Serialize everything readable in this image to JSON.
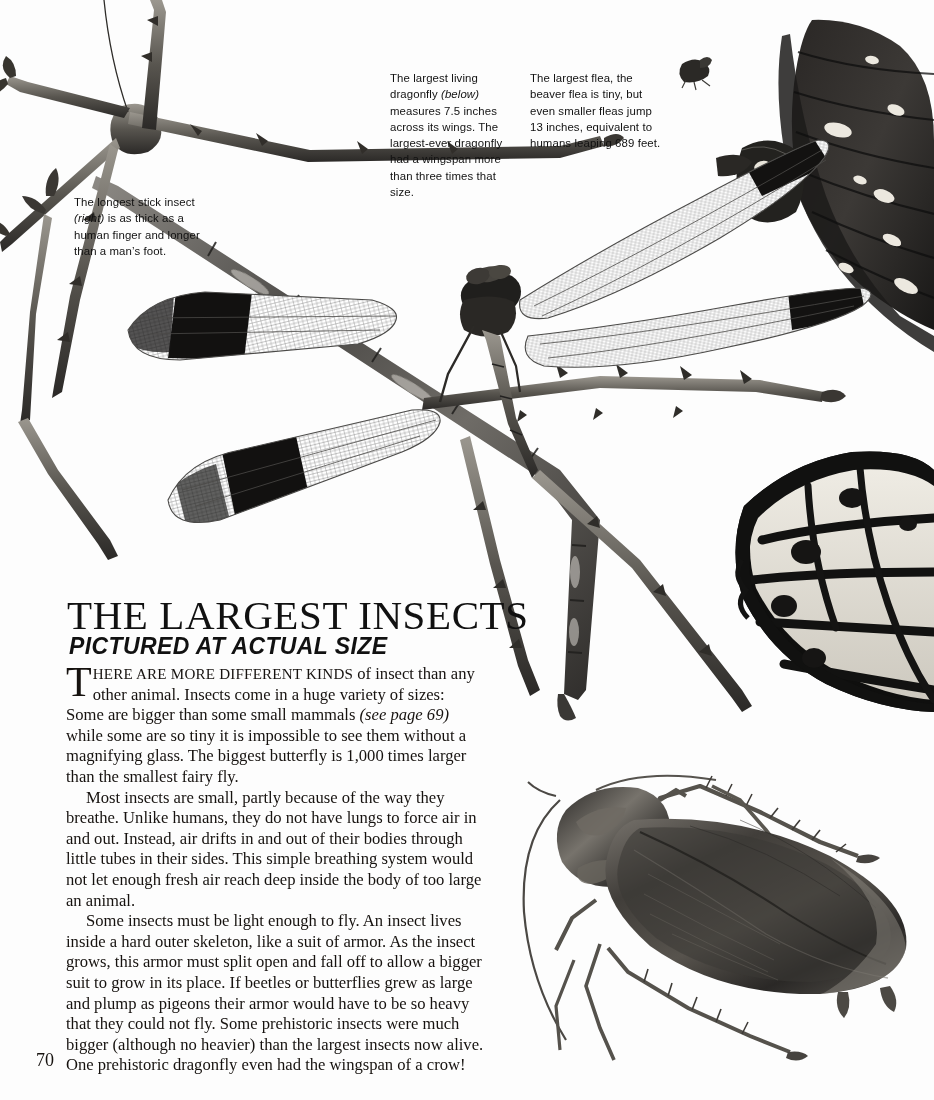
{
  "page": {
    "number": "70",
    "background": "#ffffff",
    "ink": "#111111"
  },
  "header": {
    "title": "THE LARGEST INSECTS",
    "subtitle": "PICTURED AT ACTUAL SIZE"
  },
  "captions": {
    "stick_insect": {
      "text_before": "The longest stick insect ",
      "italic": "(right)",
      "text_after": " is as thick as a human finger and longer than a man’s foot."
    },
    "dragonfly": {
      "text_before": "The largest living dragonfly ",
      "italic": "(below)",
      "text_after": " measures 7.5 inches across its wings. The largest-ever dragonfly had a wingspan more than three times that size."
    },
    "flea": {
      "text": "The largest flea, the beaver flea is tiny, but even smaller fleas jump 13 inches, equivalent to humans leaping 689 feet."
    }
  },
  "body": {
    "p1_dropcap": "T",
    "p1_smallcaps": "HERE ARE MORE DIFFERENT KINDS",
    "p1_part1": " of insect than any other animal. Insects come in a huge variety of sizes: Some are bigger than some small mammals ",
    "p1_italic": "(see page 69)",
    "p1_part2": " while some are so tiny it is impossible to see them without a magnifying glass. The biggest butterfly is 1,000 times larger than the smallest fairy fly.",
    "p2": "Most insects are small, partly because of the way they breathe. Unlike humans, they do not have lungs to force air in and out. Instead, air drifts in and out of their bodies through little tubes in their sides. This simple breathing system would not let enough fresh air reach deep inside the body of too large an animal.",
    "p3": "Some insects must be light enough to fly. An insect lives inside a hard outer skeleton, like a suit of armor. As the insect grows, this armor must split open and fall off to allow a bigger suit to grow in its place. If beetles or butterflies grew as large and plump as pigeons their armor would have to be so heavy that they could not fly. Some prehistoric insects were much bigger (although no heavier) than the largest insects now alive. One prehistoric dragonfly even had the wingspan of a crow!"
  },
  "illustrations": {
    "stick_insect": "stick-insect-illustration",
    "dragonfly": "dragonfly-illustration",
    "butterfly": "butterfly-wings-illustration",
    "cockroach": "cockroach-illustration",
    "flea": "flea-illustration"
  }
}
